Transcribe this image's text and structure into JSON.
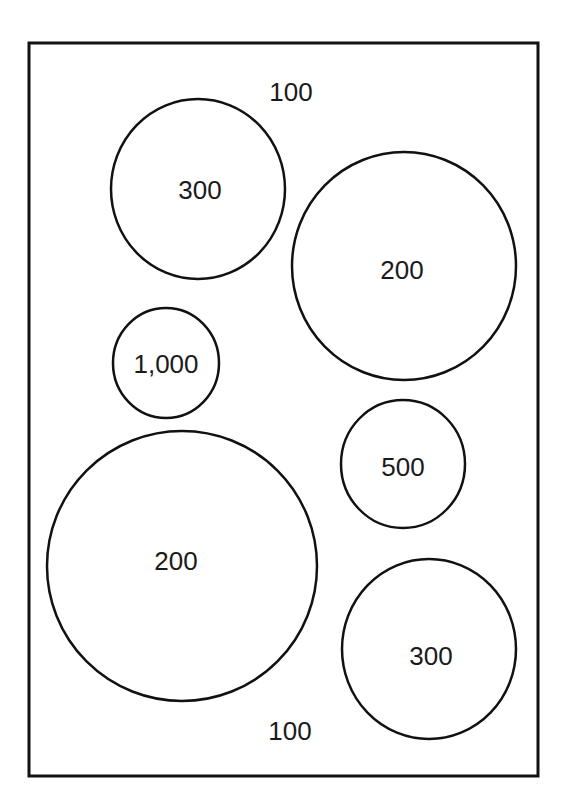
{
  "diagram": {
    "outer_label_top": "100",
    "outer_label_bottom": "100",
    "circles": [
      {
        "label": "300",
        "id": "circle-300-top-left"
      },
      {
        "label": "200",
        "id": "circle-200-top-right"
      },
      {
        "label": "1,000",
        "id": "circle-1000"
      },
      {
        "label": "500",
        "id": "circle-500"
      },
      {
        "label": "200",
        "id": "circle-200-bottom-left"
      },
      {
        "label": "300",
        "id": "circle-300-bottom-right"
      }
    ],
    "stroke_color": "#111111",
    "background_color": "#ffffff"
  }
}
